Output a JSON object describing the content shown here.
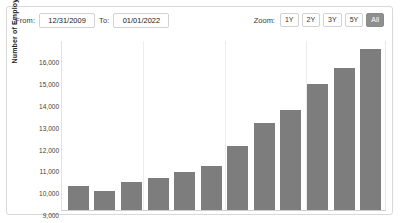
{
  "toolbar": {
    "from_label": "From:",
    "from_value": "12/31/2009",
    "to_label": "To:",
    "to_value": "01/01/2022",
    "zoom_label": "Zoom:",
    "zoom_buttons": [
      {
        "label": "1Y",
        "active": false
      },
      {
        "label": "2Y",
        "active": false
      },
      {
        "label": "3Y",
        "active": false
      },
      {
        "label": "5Y",
        "active": false
      },
      {
        "label": "All",
        "active": true
      }
    ],
    "active_color": "#8f8f8f"
  },
  "chart_data": {
    "type": "bar",
    "title": "",
    "xlabel": "",
    "ylabel": "Number of Employees",
    "ylim": [
      9000,
      16800
    ],
    "ytick_labels": [
      "16,000",
      "15,000",
      "14,000",
      "13,000",
      "12,000",
      "11,000",
      "10,000",
      "9,000"
    ],
    "ytick_values": [
      16000,
      15000,
      14000,
      13000,
      12000,
      11000,
      10000,
      9000
    ],
    "grid": true,
    "legend": "none",
    "bar_color": "#7d7d7d",
    "categories": [
      "2010",
      "2011",
      "2012",
      "2013",
      "2014",
      "2015",
      "2016",
      "2017",
      "2018",
      "2019",
      "2020",
      "2021"
    ],
    "values": [
      10100,
      9850,
      10300,
      10450,
      10750,
      11000,
      11950,
      13000,
      13600,
      14800,
      15500,
      16400
    ]
  }
}
